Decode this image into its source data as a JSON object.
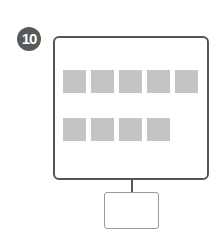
{
  "badge": {
    "label": "10",
    "color": "#595959"
  },
  "diagram": {
    "main_box": {
      "border_color": "#555555"
    },
    "tile_color": "#c4c4c4",
    "rows": [
      {
        "count": 5,
        "top": 70,
        "lefts": [
          63,
          91,
          119,
          147,
          175
        ]
      },
      {
        "count": 4,
        "top": 118,
        "lefts": [
          63,
          91,
          119,
          147
        ]
      }
    ],
    "sub_box": {
      "border_color": "#9a9a9a"
    }
  }
}
